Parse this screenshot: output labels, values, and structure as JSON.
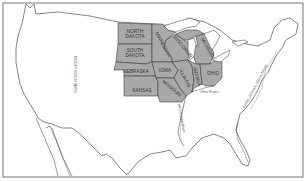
{
  "map": {
    "title": "",
    "colors": {
      "highlight_fill": "#a9a9a9",
      "land_fill": "#ffffff",
      "border": "#333333",
      "water": "#ffffff"
    },
    "states": [
      {
        "id": "north-dakota",
        "label_line1": "NORTH",
        "label_line2": "DAKOTA"
      },
      {
        "id": "south-dakota",
        "label_line1": "SOUTH",
        "label_line2": "DAKOTA"
      },
      {
        "id": "nebraska",
        "label_line1": "NEBRASKA",
        "label_line2": ""
      },
      {
        "id": "kansas",
        "label_line1": "KANSAS",
        "label_line2": ""
      },
      {
        "id": "minnesota",
        "label_line1": "MINNESOTA",
        "label_line2": ""
      },
      {
        "id": "iowa",
        "label_line1": "IOWA",
        "label_line2": ""
      },
      {
        "id": "missouri",
        "label_line1": "MISSOURI",
        "label_line2": ""
      },
      {
        "id": "wisconsin",
        "label_line1": "WISCONSIN",
        "label_line2": ""
      },
      {
        "id": "michigan",
        "label_line1": "MICHIGAN",
        "label_line2": ""
      },
      {
        "id": "illinois",
        "label_line1": "ILLINOIS",
        "label_line2": ""
      },
      {
        "id": "indiana",
        "label_line1": "INDIANA",
        "label_line2": ""
      },
      {
        "id": "ohio",
        "label_line1": "OHIO",
        "label_line2": ""
      }
    ],
    "features": {
      "rocky_mountains": "ROCKY MOUNTAINS",
      "appalachian_mountains": "APPALACHIAN MOUNTAINS",
      "ohio_river": "Ohio River",
      "mississippi_river": "Mississippi River"
    }
  }
}
